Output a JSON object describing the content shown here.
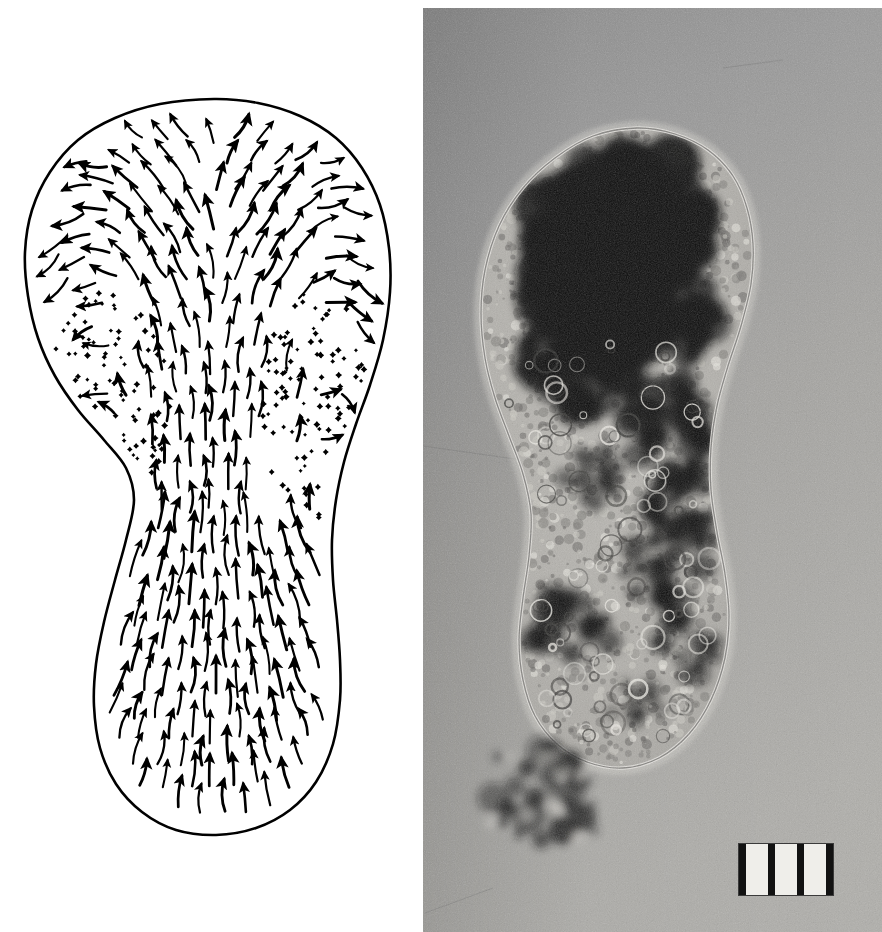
{
  "figure": {
    "type": "two-panel scientific figure",
    "background_color": "#ffffff",
    "width": 882,
    "height": 932
  },
  "panels": [
    {
      "id": "drawing",
      "name": "vector-flow-diagram",
      "kind": "line-drawing",
      "caption_text": "",
      "description": "Outline drawing of an amoeba with arrows indicating direction of cytoplasmic streaming (fountain flow) and stippling marking the ectoplasmic gel regions.",
      "ink_color": "#000000",
      "paper_color": "#ffffff",
      "regions": [
        {
          "label": "anterior-hyaline-cap",
          "note": "broad bulbous front end at top where arrows fan outward"
        },
        {
          "label": "endoplasm-axial-stream",
          "note": "central column of arrows flowing forward"
        },
        {
          "label": "ectoplasm-gel-tube-left",
          "note": "stippled dotted zone on the left flank"
        },
        {
          "label": "ectoplasm-gel-tube-right",
          "note": "stippled dotted zone on the right flank"
        },
        {
          "label": "uroid-tail",
          "note": "rounded posterior end at bottom"
        }
      ]
    },
    {
      "id": "photo",
      "name": "phase-contrast-micrograph",
      "kind": "photomicrograph",
      "description": "Grainy black and white light micrograph of the same amoeba, showing a dense dark mass of granules and food vacuoles in the anterior, granular cytoplasm throughout, and adherent debris at the lower left.",
      "background_color": "#9c9c9c",
      "cell_interior_color": "#b4b2ad",
      "dark_granule_color": "#121212",
      "features": [
        {
          "label": "dark-granule-mass",
          "note": "large very dark aggregate filling the anterior region"
        },
        {
          "label": "granular-cytoplasm",
          "note": "mottled mid-grey interior with many small vacuoles"
        },
        {
          "label": "cell-membrane-outline",
          "note": "bright thin rim around the whole cell"
        },
        {
          "label": "hyaline-cap",
          "note": "clear pale zone at the advancing front"
        },
        {
          "label": "adherent-debris",
          "note": "clump of dark particles attached near the lower left margin"
        }
      ]
    }
  ],
  "scalebar": {
    "name": "micrometer-graticule",
    "tick_count": 4,
    "interval_count": 3,
    "box_fill": "#efeeea",
    "tick_color": "#121212",
    "border_color": "#3a3a3a",
    "label": ""
  },
  "chart_data": {
    "type": "quiver",
    "title": "",
    "subtitle": "",
    "xlabel": "",
    "ylabel": "",
    "grid": false,
    "legend_position": "none",
    "annotations": [
      "central axial stream directed anteriorly",
      "recirculation outward and backward at the anterior cap",
      "stippled stationary ectoplasmic gel along both flanks",
      "converging forward flow in the posterior uroid"
    ],
    "stipple_regions": [
      {
        "name": "left-gel",
        "dot_count": 78
      },
      {
        "name": "right-gel",
        "dot_count": 92
      }
    ],
    "outline_points": [
      [
        214,
        99
      ],
      [
        258,
        103
      ],
      [
        300,
        116
      ],
      [
        336,
        138
      ],
      [
        362,
        168
      ],
      [
        380,
        205
      ],
      [
        389,
        248
      ],
      [
        390,
        292
      ],
      [
        383,
        340
      ],
      [
        370,
        385
      ],
      [
        356,
        424
      ],
      [
        344,
        462
      ],
      [
        336,
        500
      ],
      [
        332,
        540
      ],
      [
        333,
        580
      ],
      [
        337,
        620
      ],
      [
        340,
        660
      ],
      [
        340,
        700
      ],
      [
        333,
        744
      ],
      [
        316,
        782
      ],
      [
        290,
        810
      ],
      [
        256,
        828
      ],
      [
        216,
        835
      ],
      [
        176,
        830
      ],
      [
        142,
        812
      ],
      [
        116,
        784
      ],
      [
        100,
        748
      ],
      [
        94,
        706
      ],
      [
        96,
        664
      ],
      [
        104,
        622
      ],
      [
        115,
        580
      ],
      [
        126,
        540
      ],
      [
        134,
        500
      ],
      [
        126,
        468
      ],
      [
        104,
        440
      ],
      [
        78,
        410
      ],
      [
        55,
        376
      ],
      [
        38,
        338
      ],
      [
        28,
        296
      ],
      [
        25,
        252
      ],
      [
        32,
        210
      ],
      [
        50,
        172
      ],
      [
        78,
        140
      ],
      [
        115,
        118
      ],
      [
        160,
        104
      ],
      [
        214,
        99
      ]
    ]
  }
}
